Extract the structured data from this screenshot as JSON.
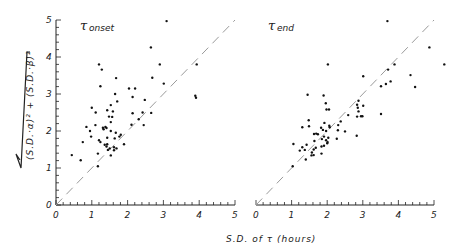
{
  "figure": {
    "ylabel": "√((S.D.·α)² + (S.D.·β)²)",
    "ylabel_inner": "(S.D.·α)² + (S.D.·β)²",
    "xlabel": "S.D. of τ (hours)",
    "colors": {
      "ink": "#222222",
      "points": "#111111",
      "diagonal": "#9a9a9a",
      "background": "#ffffff"
    }
  },
  "panels": [
    {
      "id": "onset",
      "symbol": "τ",
      "subscript": "onset"
    },
    {
      "id": "end",
      "symbol": "τ",
      "subscript": "end"
    }
  ],
  "chart_data": [
    {
      "type": "scatter",
      "title": "τ onset",
      "xlabel": "S.D. of τ (hours)",
      "ylabel": "√((S.D.·α)² + (S.D.·β)²)",
      "xlim": [
        0,
        5
      ],
      "ylim": [
        0,
        5
      ],
      "x_ticks": [
        "0",
        "1",
        "2",
        "3",
        "4",
        "5"
      ],
      "y_ticks": [
        "0",
        "1",
        "2",
        "3",
        "4",
        "5"
      ],
      "grid": false,
      "reference_line": "y = x (dashed)",
      "points": [
        [
          3.09,
          4.97
        ],
        [
          2.65,
          4.26
        ],
        [
          1.2,
          3.8
        ],
        [
          1.28,
          3.66
        ],
        [
          2.9,
          3.8
        ],
        [
          3.93,
          3.8
        ],
        [
          1.68,
          3.43
        ],
        [
          2.69,
          3.44
        ],
        [
          3.01,
          3.28
        ],
        [
          1.24,
          3.21
        ],
        [
          2.04,
          3.15
        ],
        [
          2.21,
          3.15
        ],
        [
          1.65,
          3.0
        ],
        [
          2.14,
          2.92
        ],
        [
          3.89,
          2.95
        ],
        [
          3.91,
          2.9
        ],
        [
          1.71,
          2.8
        ],
        [
          2.48,
          2.84
        ],
        [
          1.53,
          2.7
        ],
        [
          1.0,
          2.63
        ],
        [
          1.43,
          2.56
        ],
        [
          1.59,
          2.53
        ],
        [
          1.11,
          2.5
        ],
        [
          2.14,
          2.48
        ],
        [
          2.42,
          2.5
        ],
        [
          2.66,
          2.49
        ],
        [
          1.48,
          2.39
        ],
        [
          1.57,
          2.38
        ],
        [
          2.31,
          2.32
        ],
        [
          1.53,
          2.24
        ],
        [
          2.11,
          2.17
        ],
        [
          2.45,
          2.16
        ],
        [
          1.1,
          2.16
        ],
        [
          0.85,
          2.11
        ],
        [
          1.38,
          2.11
        ],
        [
          1.31,
          2.09
        ],
        [
          1.41,
          2.08
        ],
        [
          1.33,
          2.05
        ],
        [
          0.95,
          2.0
        ],
        [
          1.53,
          2.0
        ],
        [
          1.67,
          1.95
        ],
        [
          1.81,
          1.9
        ],
        [
          1.77,
          1.85
        ],
        [
          0.98,
          1.85
        ],
        [
          1.43,
          1.82
        ],
        [
          1.64,
          1.8
        ],
        [
          1.2,
          1.75
        ],
        [
          1.24,
          1.7
        ],
        [
          0.75,
          1.7
        ],
        [
          1.43,
          1.64
        ],
        [
          1.36,
          1.63
        ],
        [
          1.9,
          1.64
        ],
        [
          1.41,
          1.58
        ],
        [
          1.62,
          1.56
        ],
        [
          1.5,
          1.53
        ],
        [
          1.69,
          1.53
        ],
        [
          1.62,
          1.48
        ],
        [
          1.45,
          1.49
        ],
        [
          1.17,
          1.39
        ],
        [
          1.53,
          1.34
        ],
        [
          0.44,
          1.35
        ],
        [
          0.69,
          1.21
        ],
        [
          1.17,
          1.05
        ]
      ]
    },
    {
      "type": "scatter",
      "title": "τ end",
      "xlabel": "S.D. of τ (hours)",
      "ylabel": "√((S.D.·α)² + (S.D.·β)²)",
      "xlim": [
        0,
        5
      ],
      "ylim": [
        0,
        5
      ],
      "x_ticks": [
        "0",
        "1",
        "2",
        "3",
        "4",
        "5"
      ],
      "y_ticks": [
        "0",
        "1",
        "2",
        "3",
        "4",
        "5"
      ],
      "grid": false,
      "reference_line": "y = x (dashed)",
      "points": [
        [
          3.69,
          4.97
        ],
        [
          4.87,
          4.26
        ],
        [
          2.02,
          3.8
        ],
        [
          3.89,
          3.8
        ],
        [
          5.29,
          3.8
        ],
        [
          3.71,
          3.66
        ],
        [
          3.01,
          3.48
        ],
        [
          4.34,
          3.51
        ],
        [
          3.78,
          3.34
        ],
        [
          3.65,
          3.27
        ],
        [
          3.51,
          3.21
        ],
        [
          4.47,
          3.19
        ],
        [
          1.45,
          2.98
        ],
        [
          1.9,
          2.96
        ],
        [
          2.88,
          2.82
        ],
        [
          2.84,
          2.71
        ],
        [
          3.01,
          2.68
        ],
        [
          2.86,
          2.63
        ],
        [
          1.96,
          2.75
        ],
        [
          3.51,
          2.46
        ],
        [
          2.88,
          2.53
        ],
        [
          1.98,
          2.58
        ],
        [
          2.05,
          2.58
        ],
        [
          2.84,
          2.39
        ],
        [
          2.95,
          2.4
        ],
        [
          2.99,
          2.4
        ],
        [
          2.59,
          2.43
        ],
        [
          1.48,
          2.29
        ],
        [
          2.38,
          2.26
        ],
        [
          1.92,
          2.22
        ],
        [
          2.31,
          2.16
        ],
        [
          2.06,
          2.14
        ],
        [
          1.3,
          2.1
        ],
        [
          1.49,
          2.13
        ],
        [
          2.07,
          2.1
        ],
        [
          1.83,
          2.09
        ],
        [
          1.88,
          2.03
        ],
        [
          1.97,
          2.0
        ],
        [
          2.5,
          1.99
        ],
        [
          2.3,
          2.02
        ],
        [
          1.69,
          1.93
        ],
        [
          1.63,
          1.92
        ],
        [
          1.74,
          1.91
        ],
        [
          2.83,
          1.87
        ],
        [
          1.91,
          1.85
        ],
        [
          2.03,
          1.82
        ],
        [
          2.27,
          1.79
        ],
        [
          1.85,
          1.78
        ],
        [
          1.97,
          1.75
        ],
        [
          1.64,
          1.73
        ],
        [
          2.01,
          1.7
        ],
        [
          2.0,
          1.67
        ],
        [
          1.05,
          1.65
        ],
        [
          1.42,
          1.63
        ],
        [
          1.91,
          1.6
        ],
        [
          1.84,
          1.58
        ],
        [
          1.3,
          1.56
        ],
        [
          1.68,
          1.55
        ],
        [
          1.37,
          1.49
        ],
        [
          1.62,
          1.5
        ],
        [
          1.23,
          1.47
        ],
        [
          1.57,
          1.42
        ],
        [
          1.84,
          1.39
        ],
        [
          1.56,
          1.34
        ],
        [
          1.62,
          1.35
        ],
        [
          1.4,
          1.23
        ],
        [
          1.03,
          1.05
        ]
      ]
    }
  ]
}
